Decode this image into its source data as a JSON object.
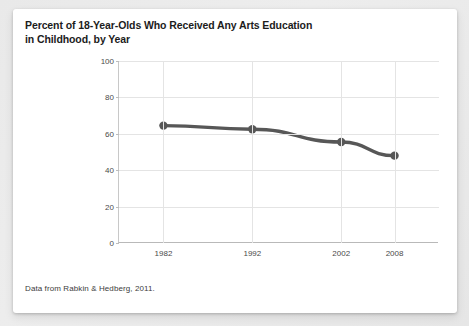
{
  "card": {
    "title_line1": "Percent of 18-Year-Olds Who Received Any Arts Education",
    "title_line2": "in Childhood, by Year",
    "source_note": "Data from Rabkin & Hedberg, 2011."
  },
  "chart_data": {
    "type": "line",
    "title": "Percent of 18-Year-Olds Who Received Any Arts Education in Childhood, by Year",
    "xlabel": "",
    "ylabel": "",
    "categories": [
      "1982",
      "1992",
      "2002",
      "2008"
    ],
    "x": [
      1982,
      1992,
      2002,
      2008
    ],
    "values": [
      64.5,
      62.5,
      55.5,
      48.0
    ],
    "series": [
      {
        "name": "Percent receiving any arts education",
        "values": [
          64.5,
          62.5,
          55.5,
          48.0
        ]
      }
    ],
    "ylim": [
      0,
      100
    ],
    "yticks": [
      0,
      20,
      40,
      60,
      80,
      100
    ],
    "ytick_labels": [
      "0",
      "20",
      "40",
      "60",
      "80",
      "100"
    ],
    "xlim": [
      1977,
      2013
    ],
    "xticks": [
      1982,
      1992,
      2002,
      2008
    ],
    "xtick_labels": [
      "1982",
      "1992",
      "2002",
      "2008"
    ],
    "grid": true,
    "legend": false,
    "legend_position": "none",
    "line_color": "#575757",
    "marker_color": "#575757",
    "marker": "circle",
    "grid_color": "#e4e4e4",
    "axis_color": "#bdbdbd",
    "background_color": "#ffffff",
    "annotations": []
  }
}
